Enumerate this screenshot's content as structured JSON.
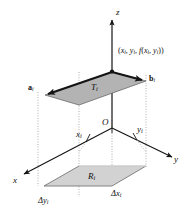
{
  "figure": {
    "type": "3d-math-diagram",
    "background_color": "#ffffff",
    "stroke_color": "#101010"
  },
  "axes": {
    "x_label": "x",
    "y_label": "y",
    "z_label": "z",
    "origin_label": "O"
  },
  "tick_labels": {
    "x_i": "x",
    "x_i_sub": "i",
    "y_i": "y",
    "y_i_sub": "i"
  },
  "upper_surface": {
    "name": "tangent-parallelogram",
    "label": "T",
    "label_sub": "i",
    "fill_color": "#b3b3b3",
    "edge_color": "#141414",
    "point_label": "(x",
    "point_label_full": "(x_i, y_i, f(x_i, y_i))",
    "point_parts": {
      "open": "(",
      "x": "x",
      "i1": "i",
      "sep1": ", ",
      "y": "y",
      "i2": "i",
      "sep2": ", ",
      "f": "f",
      "open2": "(",
      "x2": "x",
      "i3": "i",
      "sep3": ", ",
      "y2": "y",
      "i4": "i",
      "close2": ")",
      "close": ")"
    }
  },
  "vectors": [
    {
      "name": "vector-a",
      "label": "a",
      "label_sub": "i",
      "direction": "toward-lower-left",
      "color": "#141414"
    },
    {
      "name": "vector-b",
      "label": "b",
      "label_sub": "i",
      "direction": "toward-lower-right",
      "color": "#141414"
    }
  ],
  "base_region": {
    "name": "base-rectangle",
    "label": "R",
    "label_sub": "i",
    "fill_color": "#d2d2d2",
    "edge_color": "#6e6e6e",
    "width_label": "Δx",
    "width_label_sub": "i",
    "height_label": "Δy",
    "height_label_sub": "i"
  },
  "guides": {
    "style": "dotted",
    "color": "#9a9a9a"
  }
}
